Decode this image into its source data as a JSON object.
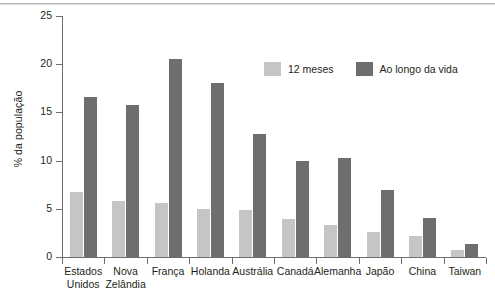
{
  "chart_data": {
    "type": "bar",
    "title": "",
    "xlabel": "",
    "ylabel": "% da população",
    "ylim": [
      0,
      25
    ],
    "yticks": [
      0,
      5,
      10,
      15,
      20,
      25
    ],
    "ytick_labels": [
      "0",
      "5",
      "10",
      "15",
      "20",
      "25"
    ],
    "grid": false,
    "legend_position": "upper-right-inside",
    "categories": [
      "Estados Unidos",
      "Nova Zelândia",
      "França",
      "Holanda",
      "Austrália",
      "Canadá",
      "Alemanha",
      "Japão",
      "China",
      "Taiwan"
    ],
    "category_lines": [
      [
        "Estados",
        "Unidos"
      ],
      [
        "Nova",
        "Zelândia"
      ],
      [
        "França"
      ],
      [
        "Holanda"
      ],
      [
        "Austrália"
      ],
      [
        "Canadá"
      ],
      [
        "Alemanha"
      ],
      [
        "Japão"
      ],
      [
        "China"
      ],
      [
        "Taiwan"
      ]
    ],
    "series": [
      {
        "name": "12 meses",
        "color": "#c5c5c5",
        "values": [
          6.7,
          5.8,
          5.6,
          5.0,
          4.9,
          3.9,
          3.3,
          2.6,
          2.2,
          0.7
        ]
      },
      {
        "name": "Ao longo da vida",
        "color": "#6e6e6e",
        "values": [
          16.6,
          15.8,
          20.5,
          18.1,
          12.8,
          10.0,
          10.3,
          6.9,
          4.0,
          1.3
        ]
      }
    ]
  },
  "legend": {
    "items": [
      {
        "label": "12 meses"
      },
      {
        "label": "Ao longo da vida"
      }
    ]
  },
  "axes": {
    "y_title": "% da população"
  },
  "colors": {
    "series_12_meses": "#c5c5c5",
    "series_ao_longo_da_vida": "#6e6e6e",
    "axis": "#6d6d6d",
    "text": "#231f20",
    "background": "#ffffff"
  }
}
